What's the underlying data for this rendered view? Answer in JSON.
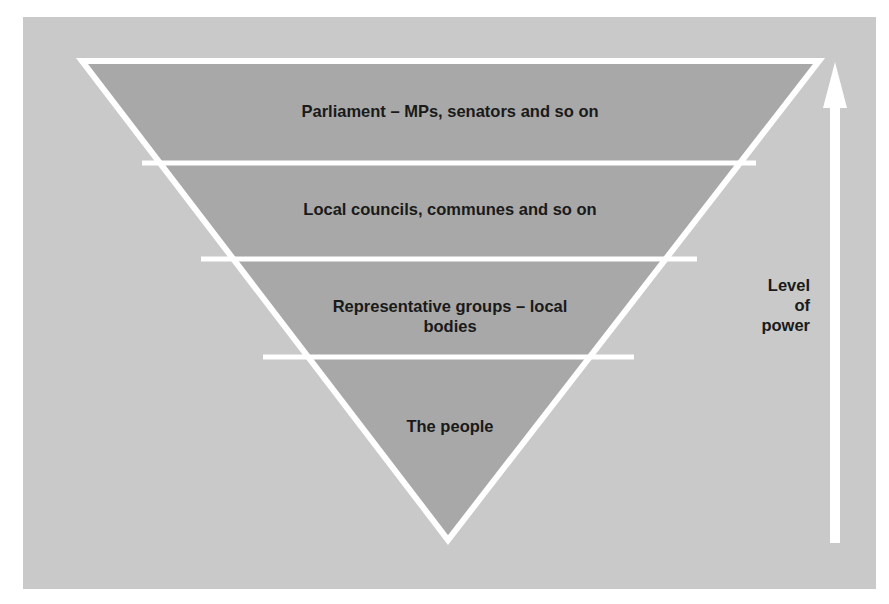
{
  "diagram": {
    "colors": {
      "background": "#ffffff",
      "panel": "#c9c9c9",
      "band_fill": "#a8a8a8",
      "divider": "#ffffff",
      "text": "#1a1a1a",
      "arrow": "#ffffff"
    },
    "bands": [
      {
        "label": "Parliament – MPs, senators and so on"
      },
      {
        "label": "Local councils, communes and so on"
      },
      {
        "label_line1": "Representative groups – local",
        "label_line2": "bodies"
      },
      {
        "label": "The people"
      }
    ],
    "axis": {
      "label_line1": "Level",
      "label_line2": "of",
      "label_line3": "power",
      "direction": "up",
      "icon": "arrow-up-icon"
    }
  }
}
